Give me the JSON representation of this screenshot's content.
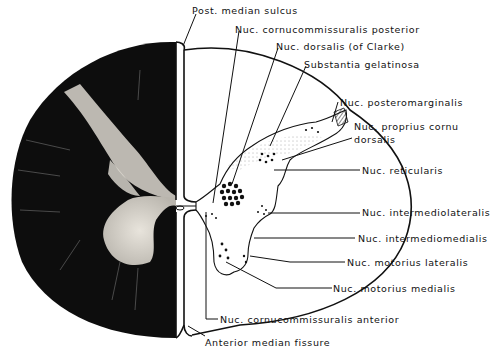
{
  "figure": {
    "type": "anatomical cross-section of spinal cord",
    "left_half": "stained histological section (myelin stain, white matter dark)",
    "right_half": "line drawing of gray matter nuclei"
  },
  "labels": {
    "post_median_sulcus": "Post. median sulcus",
    "nuc_cornucommissuralis_posterior": "Nuc. cornucommissuralis posterior",
    "nuc_dorsalis": "Nuc. dorsalis (of Clarke)",
    "substantia_gelatinosa": "Substantia gelatinosa",
    "nuc_posteromarginalis": "Nuc. posteromarginalis",
    "nuc_proprius_line1": "Nuc. proprius cornu",
    "nuc_proprius_line2": "dorsalis",
    "nuc_reticularis": "Nuc. reticularis",
    "nuc_intermediolateralis": "Nuc. intermediolateralis",
    "nuc_intermediomedialis": "Nuc. intermediomedialis",
    "nuc_motorius_lateralis": "Nuc. motorius lateralis",
    "nuc_motorius_medialis": "Nuc. motorius medialis",
    "nuc_cornucommissuralis_anterior": "Nuc. cornucommissuralis anterior",
    "anterior_median_fissure": "Anterior median fissure"
  },
  "colors": {
    "ink": "#111111",
    "section_dark": "#0d0d0d",
    "gray_matter_stain": "#d9d6cf",
    "background": "#ffffff"
  }
}
